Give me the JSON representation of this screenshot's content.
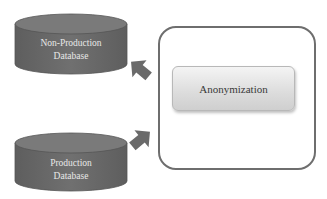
{
  "diagram": {
    "databases": [
      {
        "id": "non-production",
        "label_line1": "Non-Production",
        "label_line2": "Database"
      },
      {
        "id": "production",
        "label_line1": "Production",
        "label_line2": "Database"
      }
    ],
    "process": {
      "label": "Anonymization"
    },
    "arrows": [
      {
        "from": "process",
        "to": "non-production",
        "direction": "up-left"
      },
      {
        "from": "production",
        "to": "process",
        "direction": "up-right"
      }
    ],
    "colors": {
      "cylinder_body": "#6b6b6b",
      "cylinder_top": "#7a7a7a",
      "arrow": "#6a6a6a",
      "outer_box_border": "#6e6e6e",
      "process_fill": "#dcdcdc",
      "label_light": "#e8e8e8",
      "label_dark": "#3a3a3a"
    }
  }
}
